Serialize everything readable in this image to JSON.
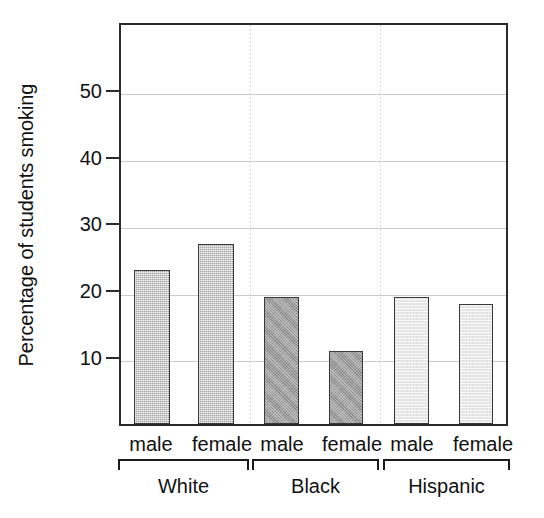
{
  "chart_data": {
    "type": "bar",
    "title": "",
    "xlabel": "",
    "ylabel": "Percentage of students smoking",
    "ylim": [
      0,
      58
    ],
    "yticks": [
      10,
      20,
      30,
      40,
      50
    ],
    "ytick_labels": [
      "10",
      "20",
      "30",
      "40",
      "50"
    ],
    "grid": "horizontal dotted gridlines at each y tick; faint vertical dotted separators between groups",
    "legend": "none",
    "categories": [
      "male",
      "female",
      "male",
      "female",
      "male",
      "female"
    ],
    "groups": [
      {
        "name": "White",
        "shade": "#a9a9a9",
        "categories": [
          "male",
          "female"
        ],
        "values": [
          23,
          27
        ]
      },
      {
        "name": "Black",
        "shade": "#979797",
        "categories": [
          "male",
          "female"
        ],
        "values": [
          19,
          11
        ]
      },
      {
        "name": "Hispanic",
        "shade": "#e9e9e9",
        "categories": [
          "male",
          "female"
        ],
        "values": [
          19,
          18
        ]
      }
    ],
    "series": [
      {
        "name": "Percentage of students smoking",
        "values": [
          23,
          27,
          19,
          11,
          19,
          18
        ]
      }
    ],
    "bars": [
      {
        "group": "White",
        "category": "male",
        "value": 23,
        "shade": "#a9a9a9"
      },
      {
        "group": "White",
        "category": "female",
        "value": 27,
        "shade": "#a9a9a9"
      },
      {
        "group": "Black",
        "category": "male",
        "value": 19,
        "shade": "#979797"
      },
      {
        "group": "Black",
        "category": "female",
        "value": 11,
        "shade": "#979797"
      },
      {
        "group": "Hispanic",
        "category": "male",
        "value": 19,
        "shade": "#e9e9e9"
      },
      {
        "group": "Hispanic",
        "category": "female",
        "value": 18,
        "shade": "#e9e9e9"
      }
    ]
  },
  "axis": {
    "y_title": "Percentage of students smoking",
    "tick_50": "50",
    "tick_40": "40",
    "tick_30": "30",
    "tick_20": "20",
    "tick_10": "10"
  },
  "labels": {
    "white_male": "male",
    "white_female": "female",
    "black_male": "male",
    "black_female": "female",
    "hispanic_male": "male",
    "hispanic_female": "female",
    "group_white": "White",
    "group_black": "Black",
    "group_hispanic": "Hispanic"
  }
}
